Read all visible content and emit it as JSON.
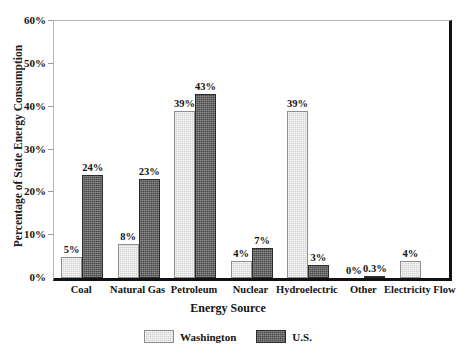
{
  "chart_data": {
    "type": "bar",
    "title": "",
    "xlabel": "Energy Source",
    "ylabel": "Percentage of State Energy Consumption",
    "ylim": [
      0,
      60
    ],
    "yticks": [
      "0%",
      "10%",
      "20%",
      "30%",
      "40%",
      "50%",
      "60%"
    ],
    "ytick_values": [
      0,
      10,
      20,
      30,
      40,
      50,
      60
    ],
    "grid": false,
    "legend_position": "bottom-center",
    "categories": [
      "Coal",
      "Natural Gas",
      "Petroleum",
      "Nuclear",
      "Hydroelectric",
      "Other",
      "Electricity Flow"
    ],
    "series": [
      {
        "name": "Washington",
        "color": "#d2d2d2",
        "values": [
          5,
          8,
          39,
          4,
          39,
          0,
          4
        ],
        "labels": [
          "5%",
          "8%",
          "39%",
          "4%",
          "39%",
          "0%",
          "4%"
        ]
      },
      {
        "name": "U.S.",
        "color": "#4a4a4a",
        "values": [
          24,
          23,
          43,
          7,
          3,
          0.3,
          null
        ],
        "labels": [
          "24%",
          "23%",
          "43%",
          "7%",
          "3%",
          "0.3%",
          ""
        ]
      }
    ]
  },
  "legend": {
    "items": [
      {
        "label": "Washington",
        "swatch": "light-gray-swatch"
      },
      {
        "label": "U.S.",
        "swatch": "dark-gray-swatch"
      }
    ]
  }
}
